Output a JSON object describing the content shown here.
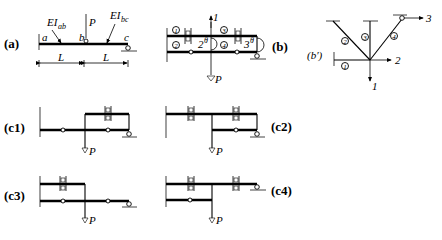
{
  "figure": {
    "panel_a": {
      "label": "(a)",
      "EI_ab": "EI",
      "EI_ab_sub": "ab",
      "EI_bc": "EI",
      "EI_bc_sub": "bc",
      "point_a": "a",
      "point_b": "b",
      "point_c": "c",
      "load": "P",
      "span1": "L",
      "span2": "L"
    },
    "panel_b": {
      "label": "(b)",
      "members": [
        "1",
        "2",
        "3",
        "4"
      ],
      "dof_1": "1",
      "dof_2": "2",
      "dof_3": "3",
      "sup": "θ",
      "load": "P"
    },
    "panel_b_prime": {
      "label": "(b′)",
      "members": [
        "1",
        "2",
        "3",
        "4"
      ],
      "dof_1": "1",
      "dof_2": "2",
      "dof_3": "3"
    },
    "panel_c1": {
      "label": "(c1)",
      "load": "P"
    },
    "panel_c2": {
      "label": "(c2)",
      "load": "P"
    },
    "panel_c3": {
      "label": "(c3)",
      "load": "P"
    },
    "panel_c4": {
      "label": "(c4)",
      "load": "P"
    }
  }
}
